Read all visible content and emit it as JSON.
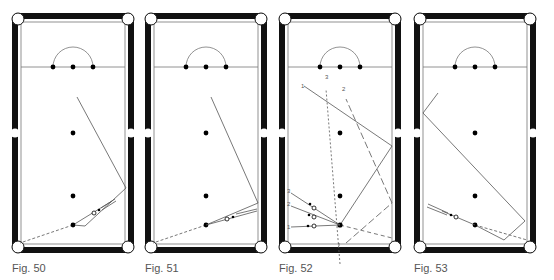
{
  "figures": [
    {
      "id": "fig50",
      "caption": "Fig. 50",
      "x": 12
    },
    {
      "id": "fig51",
      "caption": "Fig. 51",
      "x": 145
    },
    {
      "id": "fig52",
      "caption": "Fig. 52",
      "x": 279
    },
    {
      "id": "fig53",
      "caption": "Fig. 53",
      "x": 414
    }
  ],
  "fig52_labels": {
    "shot1_top": "1",
    "shot2_top": "2",
    "shot3_top": "3",
    "cue1": "1",
    "cue2": "2",
    "cue3": "3"
  },
  "colors": {
    "cushion": "#111111",
    "line": "#555555",
    "ball": "#000000",
    "background": "#ffffff"
  }
}
